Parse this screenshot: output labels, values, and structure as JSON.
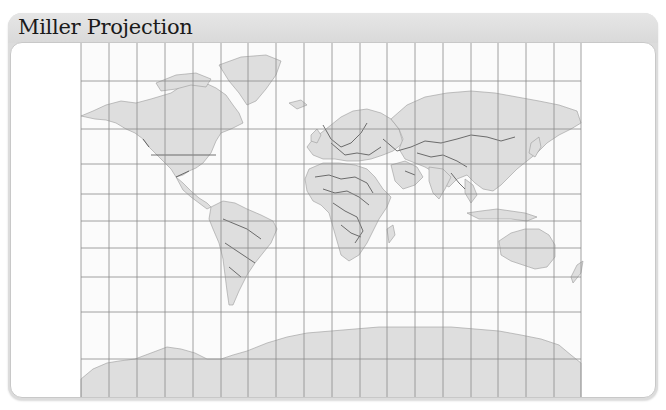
{
  "panel": {
    "title": "Miller Projection"
  },
  "map": {
    "projection": "Miller",
    "graticule": {
      "meridian_count": 19,
      "parallel_count": 9,
      "line_color": "#8a8a8a"
    },
    "colors": {
      "ocean": "#fbfbfb",
      "land": "#dedede",
      "border": "#3a3a3a",
      "coast": "#9a9a9a",
      "panel_frame": "#dcdcdc"
    },
    "continents": [
      "North America",
      "South America",
      "Europe",
      "Africa",
      "Asia",
      "Australia",
      "Antarctica",
      "Greenland"
    ]
  }
}
